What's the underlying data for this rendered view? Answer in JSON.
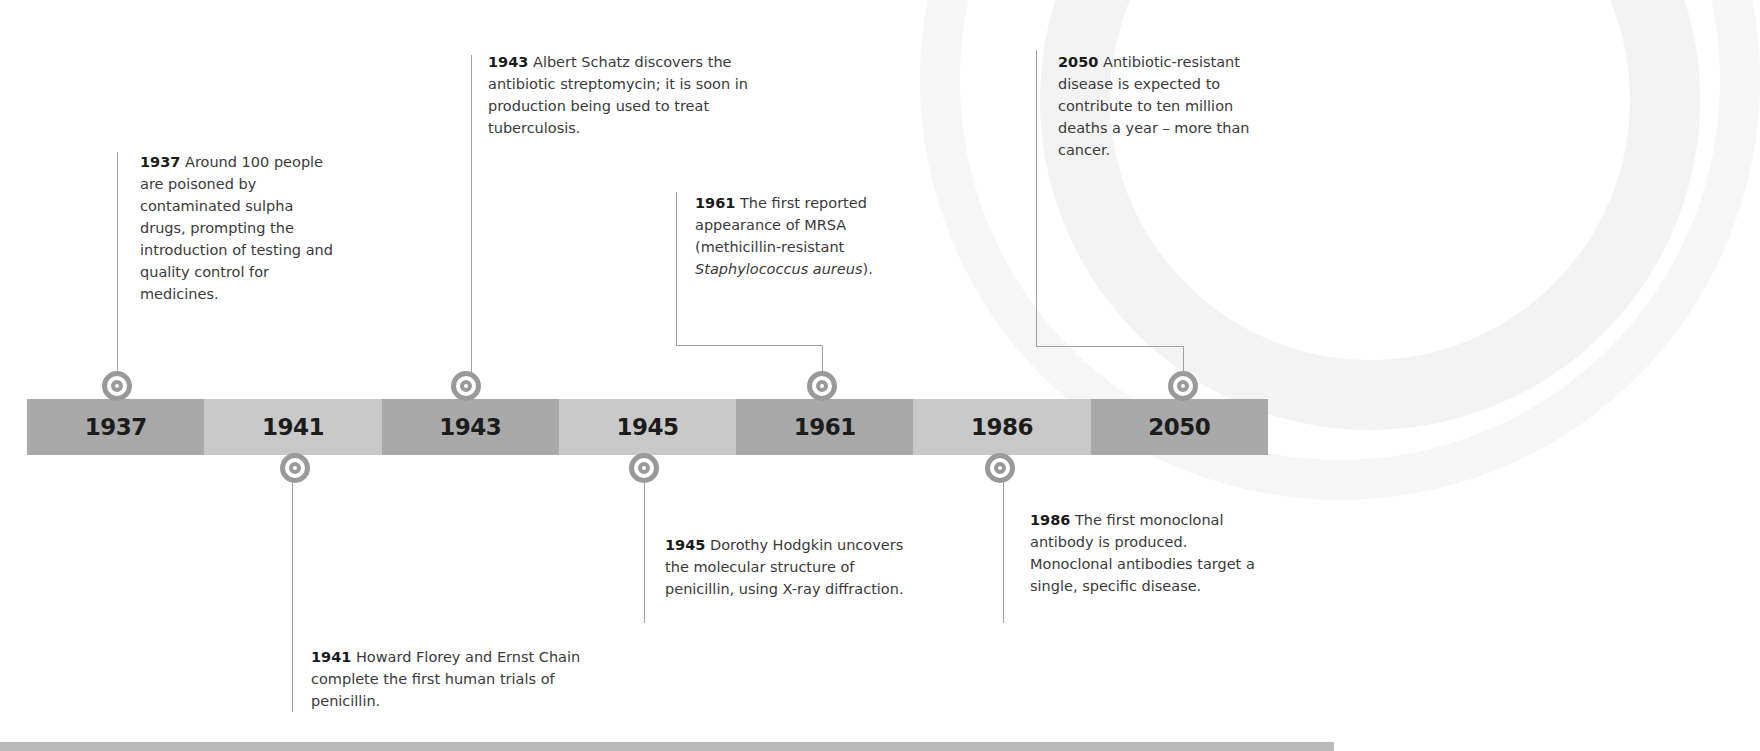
{
  "colors": {
    "segment_dark": "#a9a9a9",
    "segment_light": "#c9c9c9",
    "marker": "#9a9a9a",
    "connector": "#a0a0a0",
    "text": "#3a3a3a",
    "bottom_band": "#b9b9b9"
  },
  "timeline": {
    "segments": [
      {
        "year": "1937",
        "shade": "dark"
      },
      {
        "year": "1941",
        "shade": "light"
      },
      {
        "year": "1943",
        "shade": "dark"
      },
      {
        "year": "1945",
        "shade": "light"
      },
      {
        "year": "1961",
        "shade": "dark"
      },
      {
        "year": "1986",
        "shade": "light"
      },
      {
        "year": "2050",
        "shade": "dark"
      }
    ]
  },
  "events": [
    {
      "year": "1937",
      "position": "above",
      "text": "Around 100 people are poisoned by contaminated sulpha drugs, prompting the introduction of testing and quality control for medicines."
    },
    {
      "year": "1941",
      "position": "below",
      "text": "Howard Florey and Ernst Chain complete the first human trials of penicillin."
    },
    {
      "year": "1943",
      "position": "above",
      "text": "Albert Schatz discovers the antibiotic streptomycin; it is soon in production being used to treat tuberculosis."
    },
    {
      "year": "1945",
      "position": "below",
      "text": "Dorothy Hodgkin uncovers the molecular structure of penicillin, using X-ray diffraction."
    },
    {
      "year": "1961",
      "position": "above",
      "text_before": "The first reported appearance of MRSA (methicillin-resistant ",
      "text_italic": "Staphylococcus aureus",
      "text_after": ")."
    },
    {
      "year": "1986",
      "position": "below",
      "text": "The first monoclonal antibody is produced. Monoclonal antibodies target a single, specific disease."
    },
    {
      "year": "2050",
      "position": "above",
      "text": "Antibiotic-resistant disease is expected to contribute to ten million deaths a year – more than cancer."
    }
  ]
}
